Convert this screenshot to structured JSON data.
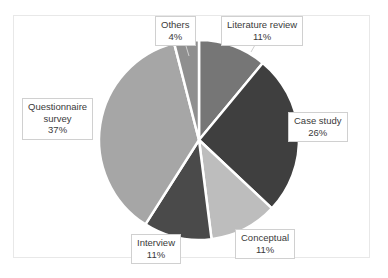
{
  "chart_data": {
    "type": "pie",
    "title": "",
    "subtitle": "",
    "xlabel": "",
    "ylabel": "",
    "legend_position": "none",
    "grid": false,
    "labels_as_callouts": true,
    "units": "percent",
    "total": 100,
    "start_angle_deg": 0,
    "direction": "clockwise",
    "categories": [
      "Literature review",
      "Case study",
      "Conceptual",
      "Interview",
      "Questionnaire survey",
      "Others"
    ],
    "values": [
      11,
      26,
      11,
      11,
      37,
      4
    ],
    "slices": [
      {
        "name": "Literature review",
        "value": 11,
        "value_text": "11%",
        "color": "#767676",
        "start_deg": 0,
        "end_deg": 39.6
      },
      {
        "name": "Case study",
        "value": 26,
        "value_text": "26%",
        "color": "#3f3f3f",
        "start_deg": 39.6,
        "end_deg": 133.2
      },
      {
        "name": "Conceptual",
        "value": 11,
        "value_text": "11%",
        "color": "#bdbdbd",
        "start_deg": 133.2,
        "end_deg": 172.8
      },
      {
        "name": "Interview",
        "value": 11,
        "value_text": "11%",
        "color": "#4a4a4a",
        "start_deg": 172.8,
        "end_deg": 212.4
      },
      {
        "name": "Questionnaire survey",
        "value": 37,
        "value_text": "37%",
        "color": "#a6a6a6",
        "start_deg": 212.4,
        "end_deg": 345.6
      },
      {
        "name": "Others",
        "value": 4,
        "value_text": "4%",
        "color": "#8f8f8f",
        "start_deg": 345.6,
        "end_deg": 360
      }
    ]
  },
  "callouts": {
    "literature": {
      "label": "Literature review",
      "percent": "11%"
    },
    "others": {
      "label": "Others",
      "percent": "4%"
    },
    "case": {
      "label": "Case study",
      "percent": "26%"
    },
    "questionnaire": {
      "label_line1": "Questionnaire",
      "label_line2": "survey",
      "percent": "37%"
    },
    "conceptual": {
      "label": "Conceptual",
      "percent": "11%"
    },
    "interview": {
      "label": "Interview",
      "percent": "11%"
    }
  },
  "style": {
    "separator_color": "#ffffff",
    "frame_color": "#e8e8e8",
    "background": "#ffffff",
    "text_color": "#3a3a3a"
  }
}
